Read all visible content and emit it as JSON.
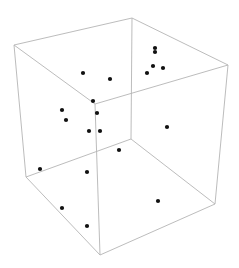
{
  "chart_data": {
    "type": "scatter",
    "subtype": "3d-scatter",
    "title": "",
    "xlabel": "",
    "ylabel": "",
    "zlabel": "",
    "axes_ticks": false,
    "grid": false,
    "legend": null,
    "box": {
      "vertices_px": {
        "top_back": [
          132,
          18
        ],
        "top_left": [
          14,
          45
        ],
        "top_right": [
          228,
          65
        ],
        "top_front": [
          95,
          104
        ],
        "bottom_back": [
          131,
          139
        ],
        "bottom_left": [
          26,
          177
        ],
        "bottom_right": [
          215,
          204
        ],
        "bottom_front": [
          100,
          255
        ]
      },
      "edge_color": "#b4b4b4"
    },
    "point_color": "#111111",
    "points_px": [
      [
        155,
        48
      ],
      [
        155,
        52
      ],
      [
        153,
        66
      ],
      [
        163,
        68
      ],
      [
        147,
        73
      ],
      [
        83,
        73
      ],
      [
        110,
        79
      ],
      [
        93,
        101
      ],
      [
        97,
        113
      ],
      [
        62,
        110
      ],
      [
        66,
        120
      ],
      [
        89,
        131
      ],
      [
        100,
        131
      ],
      [
        167,
        127
      ],
      [
        119,
        150
      ],
      [
        40,
        169
      ],
      [
        87,
        172
      ],
      [
        62,
        208
      ],
      [
        87,
        226
      ],
      [
        158,
        201
      ]
    ],
    "point_count": 20
  }
}
